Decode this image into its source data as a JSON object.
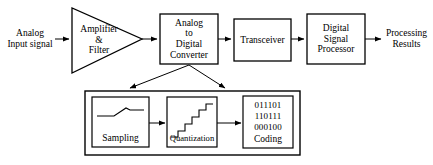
{
  "diagram": {
    "type": "block-flow-diagram",
    "stroke_color": "#000000",
    "background_color": "#ffffff",
    "top_chain": {
      "input_label": {
        "line1": "Analog",
        "line2": "Input signal"
      },
      "amplifier": {
        "shape": "triangle",
        "line1": "Amplifier",
        "line2": "&",
        "line3": "Filter"
      },
      "adc": {
        "shape": "rectangle",
        "line1": "Analog",
        "line2": "to",
        "line3": "Digital",
        "line4": "Converter"
      },
      "transceiver": {
        "shape": "rectangle",
        "line1": "Transceiver"
      },
      "dsp": {
        "shape": "rectangle",
        "line1": "Digital",
        "line2": "Signal",
        "line3": "Processor"
      },
      "output_label": {
        "line1": "Processing",
        "line2": "Results"
      }
    },
    "detail_group": {
      "sampling": {
        "label": "Sampling",
        "icon": "sampling-waveform-icon"
      },
      "quantization": {
        "label": "Quantization",
        "icon": "staircase-icon",
        "steps": 5
      },
      "coding": {
        "label": "Coding",
        "bits_line1": "011101",
        "bits_line2": "110111",
        "bits_line3": "000100"
      }
    }
  }
}
